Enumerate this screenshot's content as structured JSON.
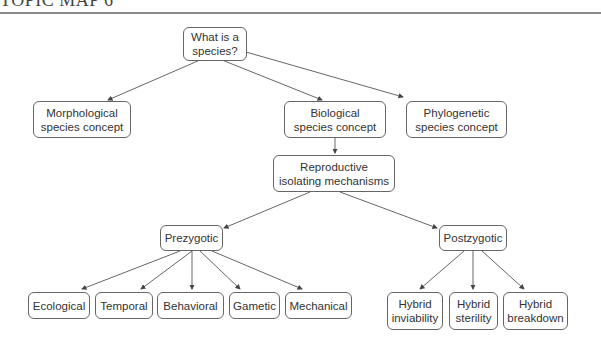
{
  "header": {
    "title": "TOPIC MAP 6"
  },
  "diagram": {
    "nodes": {
      "root": {
        "label": "What is a\nspecies?"
      },
      "morphological": {
        "label": "Morphological\nspecies concept"
      },
      "biological": {
        "label": "Biological\nspecies concept"
      },
      "phylogenetic": {
        "label": "Phylogenetic\nspecies concept"
      },
      "reproductive": {
        "label": "Reproductive\nisolating mechanisms"
      },
      "prezygotic": {
        "label": "Prezygotic"
      },
      "postzygotic": {
        "label": "Postzygotic"
      },
      "ecological": {
        "label": "Ecological"
      },
      "temporal": {
        "label": "Temporal"
      },
      "behavioral": {
        "label": "Behavioral"
      },
      "gametic": {
        "label": "Gametic"
      },
      "mechanical": {
        "label": "Mechanical"
      },
      "hybrid_inviability": {
        "label": "Hybrid\ninviability"
      },
      "hybrid_sterility": {
        "label": "Hybrid\nsterility"
      },
      "hybrid_breakdown": {
        "label": "Hybrid\nbreakdown"
      }
    },
    "edges": [
      [
        "root",
        "morphological"
      ],
      [
        "root",
        "biological"
      ],
      [
        "root",
        "phylogenetic"
      ],
      [
        "biological",
        "reproductive"
      ],
      [
        "reproductive",
        "prezygotic"
      ],
      [
        "reproductive",
        "postzygotic"
      ],
      [
        "prezygotic",
        "ecological"
      ],
      [
        "prezygotic",
        "temporal"
      ],
      [
        "prezygotic",
        "behavioral"
      ],
      [
        "prezygotic",
        "gametic"
      ],
      [
        "prezygotic",
        "mechanical"
      ],
      [
        "postzygotic",
        "hybrid_inviability"
      ],
      [
        "postzygotic",
        "hybrid_sterility"
      ],
      [
        "postzygotic",
        "hybrid_breakdown"
      ]
    ]
  }
}
